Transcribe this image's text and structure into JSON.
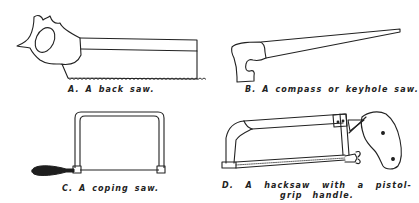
{
  "figure": {
    "ink_color": "#222222",
    "background": "#ffffff",
    "panels": [
      {
        "id": "A",
        "label": "A.",
        "caption": "A. A back saw.",
        "tool": "back-saw"
      },
      {
        "id": "B",
        "label": "B.",
        "caption": "B. A compass or keyhole saw.",
        "tool": "compass-keyhole-saw"
      },
      {
        "id": "C",
        "label": "C.",
        "caption": "C. A coping saw.",
        "tool": "coping-saw"
      },
      {
        "id": "D",
        "label": "D.",
        "caption": "D. A hacksaw with a pistol-grip handle.",
        "tool": "hacksaw-pistol-grip"
      }
    ]
  }
}
